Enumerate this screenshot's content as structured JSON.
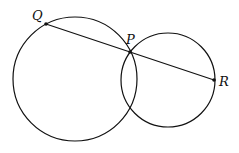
{
  "diagram": {
    "type": "geometry",
    "circles": [
      {
        "name": "large-circle",
        "cx": 75,
        "cy": 79,
        "r": 62
      },
      {
        "name": "small-circle",
        "cx": 168,
        "cy": 80,
        "r": 47
      }
    ],
    "points": {
      "Q": {
        "label": "Q",
        "x": 46,
        "y": 24
      },
      "P": {
        "label": "P",
        "x": 130,
        "y": 52
      },
      "R": {
        "label": "R",
        "x": 214,
        "y": 80
      }
    },
    "segment": {
      "from": "Q",
      "to": "R"
    }
  }
}
